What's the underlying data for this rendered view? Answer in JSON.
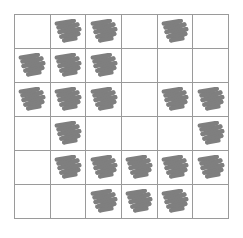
{
  "figure": {
    "type": "grid-of-marks",
    "rows": 6,
    "columns": 6,
    "cell_mark_icon": "scribble-icon",
    "mark_color": "#7f7f7f",
    "grid_line_color": "#9a9a9a",
    "background_color": "#ffffff",
    "total_marks": 19,
    "cells": [
      [
        {
          "row": 1,
          "col": 1,
          "marked": false
        },
        {
          "row": 1,
          "col": 2,
          "marked": true
        },
        {
          "row": 1,
          "col": 3,
          "marked": true
        },
        {
          "row": 1,
          "col": 4,
          "marked": false
        },
        {
          "row": 1,
          "col": 5,
          "marked": true
        },
        {
          "row": 1,
          "col": 6,
          "marked": false
        }
      ],
      [
        {
          "row": 2,
          "col": 1,
          "marked": true
        },
        {
          "row": 2,
          "col": 2,
          "marked": true
        },
        {
          "row": 2,
          "col": 3,
          "marked": true
        },
        {
          "row": 2,
          "col": 4,
          "marked": false
        },
        {
          "row": 2,
          "col": 5,
          "marked": false
        },
        {
          "row": 2,
          "col": 6,
          "marked": false
        }
      ],
      [
        {
          "row": 3,
          "col": 1,
          "marked": true
        },
        {
          "row": 3,
          "col": 2,
          "marked": true
        },
        {
          "row": 3,
          "col": 3,
          "marked": true
        },
        {
          "row": 3,
          "col": 4,
          "marked": false
        },
        {
          "row": 3,
          "col": 5,
          "marked": true
        },
        {
          "row": 3,
          "col": 6,
          "marked": true
        }
      ],
      [
        {
          "row": 4,
          "col": 1,
          "marked": false
        },
        {
          "row": 4,
          "col": 2,
          "marked": true
        },
        {
          "row": 4,
          "col": 3,
          "marked": false
        },
        {
          "row": 4,
          "col": 4,
          "marked": false
        },
        {
          "row": 4,
          "col": 5,
          "marked": false
        },
        {
          "row": 4,
          "col": 6,
          "marked": true
        }
      ],
      [
        {
          "row": 5,
          "col": 1,
          "marked": false
        },
        {
          "row": 5,
          "col": 2,
          "marked": true
        },
        {
          "row": 5,
          "col": 3,
          "marked": true
        },
        {
          "row": 5,
          "col": 4,
          "marked": true
        },
        {
          "row": 5,
          "col": 5,
          "marked": true
        },
        {
          "row": 5,
          "col": 6,
          "marked": true
        }
      ],
      [
        {
          "row": 6,
          "col": 1,
          "marked": false
        },
        {
          "row": 6,
          "col": 2,
          "marked": false
        },
        {
          "row": 6,
          "col": 3,
          "marked": true
        },
        {
          "row": 6,
          "col": 4,
          "marked": true
        },
        {
          "row": 6,
          "col": 5,
          "marked": true
        },
        {
          "row": 6,
          "col": 6,
          "marked": false
        }
      ]
    ]
  }
}
